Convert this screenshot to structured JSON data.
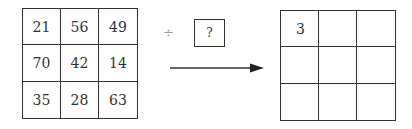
{
  "left_grid": {
    "cells": [
      "21",
      "56",
      "49",
      "70",
      "42",
      "14",
      "35",
      "28",
      "63"
    ]
  },
  "operator": {
    "symbol": "÷",
    "divisor_placeholder": "?"
  },
  "arrow": {
    "direction": "right"
  },
  "right_grid": {
    "cells": [
      "3",
      "",
      "",
      "",
      "",
      "",
      "",
      "",
      ""
    ]
  }
}
